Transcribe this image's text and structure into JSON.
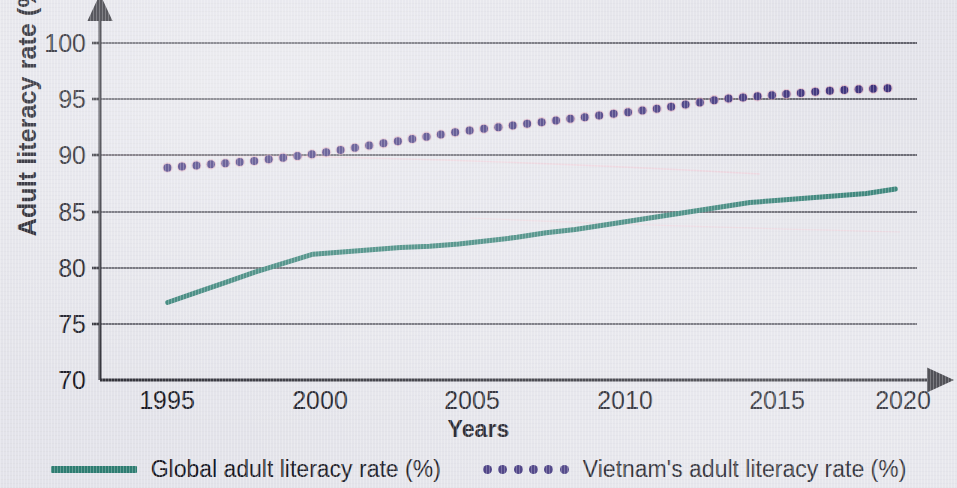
{
  "figure": {
    "background_color": "#e3e3ea",
    "axis_color": "#2b2b33",
    "grid_color": "#3a3a44"
  },
  "axes": {
    "y_title": "Adult literacy rate (%)",
    "x_title": "Years",
    "y_ticks": [
      "100",
      "95",
      "90",
      "85",
      "80",
      "75",
      "70"
    ],
    "x_ticks": [
      "1995",
      "2000",
      "2005",
      "2010",
      "2015",
      "2020"
    ]
  },
  "legend": {
    "items": [
      {
        "label": "Global adult literacy rate (%)",
        "marker": "solid-line",
        "color": "#2e7d72"
      },
      {
        "label": "Vietnam's adult literacy rate (%)",
        "marker": "dotted-line",
        "color": "#3b2f7a"
      }
    ]
  },
  "chart_data": {
    "type": "line",
    "title": "",
    "xlabel": "Years",
    "ylabel": "Adult literacy rate (%)",
    "xlim": [
      1994,
      2021
    ],
    "ylim": [
      70,
      100
    ],
    "yticks": [
      70,
      75,
      80,
      85,
      90,
      95,
      100
    ],
    "xticks": [
      1995,
      2000,
      2005,
      2010,
      2015,
      2020
    ],
    "grid": "horizontal",
    "legend_position": "below-axes",
    "x": [
      1995,
      1996,
      1997,
      1998,
      1999,
      2000,
      2001,
      2002,
      2003,
      2004,
      2005,
      2006,
      2007,
      2008,
      2009,
      2010,
      2011,
      2012,
      2013,
      2014,
      2015,
      2016,
      2017,
      2018,
      2019,
      2020
    ],
    "series": [
      {
        "name": "Global adult literacy rate (%)",
        "color": "#2e7d72",
        "style": "solid",
        "values": [
          76.9,
          77.8,
          78.7,
          79.6,
          80.4,
          81.2,
          81.4,
          81.6,
          81.8,
          81.9,
          82.1,
          82.4,
          82.7,
          83.1,
          83.4,
          83.8,
          84.2,
          84.6,
          85.0,
          85.4,
          85.8,
          86.0,
          86.2,
          86.4,
          86.6,
          87.0
        ]
      },
      {
        "name": "Vietnam's adult literacy rate (%)",
        "color": "#3b2f7a",
        "style": "dotted",
        "values": [
          88.9,
          89.1,
          89.3,
          89.5,
          89.8,
          90.1,
          90.5,
          90.9,
          91.3,
          91.7,
          92.1,
          92.4,
          92.7,
          93.0,
          93.3,
          93.6,
          93.9,
          94.2,
          94.6,
          95.0,
          95.2,
          95.4,
          95.6,
          95.8,
          95.9,
          96.0
        ]
      }
    ]
  }
}
